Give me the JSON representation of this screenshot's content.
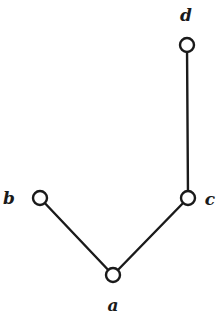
{
  "diagram": {
    "type": "graph",
    "nodes": [
      {
        "id": "d",
        "label": "d",
        "x": 187,
        "y": 45,
        "label_x": 186,
        "label_y": 21
      },
      {
        "id": "c",
        "label": "c",
        "x": 188,
        "y": 198,
        "label_x": 210,
        "label_y": 205
      },
      {
        "id": "b",
        "label": "b",
        "x": 40,
        "y": 198,
        "label_x": 9,
        "label_y": 204
      },
      {
        "id": "a",
        "label": "a",
        "x": 113,
        "y": 275,
        "label_x": 113,
        "label_y": 311
      }
    ],
    "edges": [
      {
        "from": "d",
        "to": "c"
      },
      {
        "from": "b",
        "to": "a"
      },
      {
        "from": "a",
        "to": "c"
      }
    ],
    "node_radius": 7,
    "colors": {
      "stroke": "#1a1a1a",
      "fill": "#ffffff",
      "background": "#ffffff"
    }
  }
}
